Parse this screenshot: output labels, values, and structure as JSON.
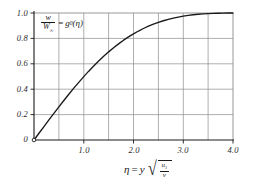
{
  "figure": {
    "background_color": "#ffffff",
    "ink_color": "#1a1a1a",
    "grid_color": "#8a8a8a"
  },
  "labels": {
    "curve_label_numerator": "w",
    "curve_label_denominator_base": "W",
    "curve_label_denominator_sub": "∞",
    "curve_label_equals": "=",
    "curve_label_function": "g",
    "curve_label_function_sub": "0",
    "curve_label_arg": "(η)",
    "xaxis_eta": "η",
    "xaxis_equals": "=",
    "xaxis_y": "y",
    "xaxis_sqrt_num_base": "u",
    "xaxis_sqrt_num_sub": "1",
    "xaxis_sqrt_den": "ν"
  },
  "chart_data": {
    "type": "line",
    "title": "",
    "xlabel": "η = y √(u₁/ν)",
    "ylabel": "w/W∞ = g₀(η)",
    "xlim": [
      0,
      4.0
    ],
    "ylim": [
      0,
      1.0
    ],
    "grid": true,
    "legend": "none",
    "x_ticks_major": [
      1.0,
      2.0,
      3.0,
      4.0
    ],
    "x_tick_labels": [
      "1.0",
      "2.0",
      "3.0",
      "4.0"
    ],
    "x_gridlines": [
      0.5,
      1.0,
      1.5,
      2.0,
      2.5,
      3.0,
      3.5,
      4.0
    ],
    "y_ticks_major": [
      0,
      0.2,
      0.4,
      0.6,
      0.8,
      1.0
    ],
    "y_tick_labels": [
      "0",
      "0.2",
      "0.4",
      "0.6",
      "0.8",
      "1.0"
    ],
    "y_gridlines": [
      0.2,
      0.4,
      0.6,
      0.8,
      1.0
    ],
    "origin_marker": true,
    "series": [
      {
        "name": "g0(eta)",
        "color": "#1a1a1a",
        "x": [
          0.0,
          0.1,
          0.2,
          0.3,
          0.4,
          0.5,
          0.6,
          0.7,
          0.8,
          0.9,
          1.0,
          1.1,
          1.2,
          1.3,
          1.4,
          1.5,
          1.6,
          1.7,
          1.8,
          1.9,
          2.0,
          2.1,
          2.2,
          2.3,
          2.4,
          2.5,
          2.6,
          2.7,
          2.8,
          2.9,
          3.0,
          3.1,
          3.2,
          3.3,
          3.4,
          3.5,
          3.6,
          3.7,
          3.8,
          3.9,
          4.0
        ],
        "y": [
          0.0,
          0.053,
          0.106,
          0.158,
          0.21,
          0.261,
          0.311,
          0.36,
          0.408,
          0.454,
          0.499,
          0.542,
          0.583,
          0.622,
          0.659,
          0.694,
          0.727,
          0.757,
          0.786,
          0.812,
          0.836,
          0.858,
          0.878,
          0.896,
          0.912,
          0.926,
          0.939,
          0.95,
          0.96,
          0.968,
          0.975,
          0.981,
          0.986,
          0.99,
          0.993,
          0.995,
          0.997,
          0.998,
          0.999,
          1.0,
          1.0
        ]
      }
    ]
  },
  "plot_geometry": {
    "left_px": 34,
    "right_px": 233,
    "top_px": 13,
    "bottom_px": 140
  }
}
